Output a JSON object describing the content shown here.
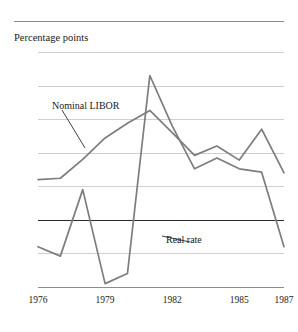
{
  "figure": {
    "top_caption_fragment": "",
    "axis_title": "Percentage points"
  },
  "chart_data": {
    "type": "line",
    "title": "",
    "subtitle": "",
    "xlabel": "",
    "ylabel": "Percentage points",
    "xlim": [
      1976,
      1987
    ],
    "ylim": [
      -10,
      25
    ],
    "ytick_values": [
      25,
      20,
      15,
      10,
      5,
      0,
      -5,
      -10
    ],
    "ytick_labels": [
      "25",
      "20",
      "15",
      "10",
      "5",
      "0",
      "−5",
      "−10"
    ],
    "xtick_values": [
      1976,
      1979,
      1982,
      1985,
      1987
    ],
    "xtick_labels": [
      "1976",
      "1979",
      "1982",
      "1985",
      "1987"
    ],
    "grid": "horizontal",
    "zero_line": true,
    "legend": "inline-annotations",
    "line_color": "#7d7d7d",
    "grid_color": "#cfcfcf",
    "zero_line_color": "#2b2b2b",
    "x": [
      1976,
      1977,
      1978,
      1979,
      1980,
      1981,
      1982,
      1983,
      1984,
      1985,
      1986,
      1987
    ],
    "series": [
      {
        "name": "Nominal LIBOR",
        "label": "Nominal LIBOR",
        "values": [
          6.0,
          6.2,
          9.0,
          12.2,
          14.4,
          16.3,
          13.0,
          9.6,
          11.0,
          8.9,
          13.5,
          7.0
        ]
      },
      {
        "name": "Real rate",
        "label": "Real rate",
        "values": [
          -4.0,
          -5.4,
          4.5,
          -9.5,
          -8.0,
          21.5,
          14.0,
          7.6,
          9.2,
          7.6,
          7.1,
          -4.0
        ]
      }
    ],
    "annotations": [
      {
        "text": "Nominal LIBOR",
        "leader": "down-right"
      },
      {
        "text": "Real rate",
        "leader": "up-left"
      }
    ]
  }
}
